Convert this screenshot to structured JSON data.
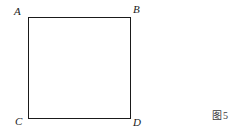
{
  "figure": {
    "kind": "square-geometry-diagram",
    "caption": {
      "label": "图",
      "number": "5",
      "full": "图 5"
    },
    "shape": {
      "name": "square",
      "stroke_color": "#1a1a1a",
      "fill_color": "#ffffff",
      "stroke_width_px": 1
    },
    "vertices": [
      {
        "key": "A",
        "label": "A",
        "position": "top-left"
      },
      {
        "key": "B",
        "label": "B",
        "position": "top-right"
      },
      {
        "key": "C",
        "label": "C",
        "position": "bottom-left"
      },
      {
        "key": "D",
        "label": "D",
        "position": "bottom-right"
      }
    ],
    "background_color": "#ffffff"
  }
}
